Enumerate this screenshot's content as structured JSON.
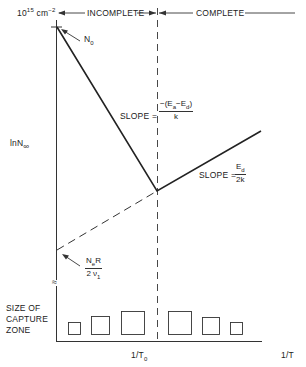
{
  "diagram": {
    "y_axis": {
      "top_label_base": "10",
      "top_label_exp": "15",
      "top_label_unit": " cm",
      "top_label_unit_exp": "−2",
      "label": "lnN",
      "label_sub": "∞",
      "break_symbol": "≈"
    },
    "x_axis": {
      "label": "1/T",
      "marker_label": "1/T",
      "marker_label_sub": "0"
    },
    "regions": {
      "left": "INCOMPLETE",
      "right": "COMPLETE"
    },
    "annotations": {
      "n0": "N",
      "n0_sub": "0",
      "slope_left_prefix": "SLOPE =",
      "slope_left_num": "−(E",
      "slope_left_num_sub1": "a",
      "slope_left_num_mid": "−E",
      "slope_left_num_sub2": "d",
      "slope_left_num_end": ")",
      "slope_left_den": "k",
      "slope_right_prefix": "SLOPE =",
      "slope_right_num": "E",
      "slope_right_num_sub": "d",
      "slope_right_den": "2k",
      "intercept_num": "N",
      "intercept_num_sub": "e",
      "intercept_num_end": "R",
      "intercept_den": "2 ν",
      "intercept_den_sub": "1"
    },
    "capture_zone": {
      "label_line1": "SIZE OF",
      "label_line2": "CAPTURE",
      "label_line3": "ZONE",
      "square_sizes_px": [
        12,
        18,
        23,
        23,
        17,
        12
      ]
    },
    "colors": {
      "ink": "#222222",
      "background": "#ffffff"
    }
  }
}
